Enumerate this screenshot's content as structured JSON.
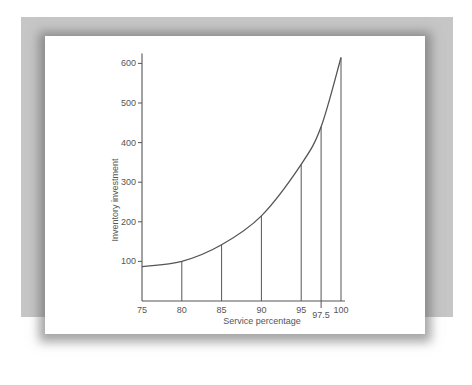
{
  "chart_data": {
    "type": "line",
    "title": "",
    "xlabel": "Service percentage",
    "ylabel": "Inventory investment",
    "x": [
      75,
      80,
      85,
      90,
      95,
      97.5,
      100
    ],
    "series": [
      {
        "name": "Inventory investment",
        "values": [
          87,
          100,
          142,
          215,
          345,
          440,
          615
        ]
      }
    ],
    "x_ticks": [
      "75",
      "80",
      "85",
      "90",
      "95",
      "97.5",
      "100"
    ],
    "y_ticks": [
      "100",
      "200",
      "300",
      "400",
      "500",
      "600"
    ],
    "xlim": [
      75,
      100
    ],
    "ylim": [
      0,
      620
    ],
    "grid": false,
    "legend": "none",
    "annotations": "vertical drop lines from the curve to the x-axis at 80, 85, 90, 95, 97.5, 100"
  },
  "colors": {
    "frame": "#c6c6c6",
    "card": "#ffffff",
    "line": "#555555",
    "text": "#555555"
  }
}
